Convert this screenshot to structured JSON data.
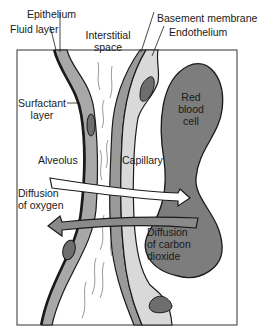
{
  "figure": {
    "labels": {
      "epithelium": "Epithelium",
      "fluid_layer": "Fluid layer",
      "interstitial_space_1": "Interstitial",
      "interstitial_space_2": "space",
      "basement_membrane": "Basement membrane",
      "endothelium": "Endothelium",
      "surfactant_layer_1": "Surfactant",
      "surfactant_layer_2": "layer",
      "red_blood_cell_1": "Red",
      "red_blood_cell_2": "blood",
      "red_blood_cell_3": "cell",
      "alveolus": "Alveolus",
      "capillary": "Capillary",
      "diffusion_oxygen_1": "Diffusion",
      "diffusion_oxygen_2": "of oxygen",
      "diffusion_co2_1": "Diffusion",
      "diffusion_co2_2": "of carbon",
      "diffusion_co2_3": "dioxide"
    },
    "arrows": [
      {
        "name": "oxygen-diffusion",
        "direction": "alveolus-to-capillary",
        "fill": "#ffffff"
      },
      {
        "name": "co2-diffusion",
        "direction": "capillary-to-alveolus",
        "fill": "#8a8a8a"
      }
    ],
    "colors": {
      "outline": "#1a1a1a",
      "epithelium_fill": "#a8a8a8",
      "endothelium_fill": "#d9d9d9",
      "basement_fill": "#9a9a9a",
      "rbc_fill": "#7d7d7d",
      "nucleus_fill": "#6e6e6e",
      "background": "#ffffff"
    }
  }
}
